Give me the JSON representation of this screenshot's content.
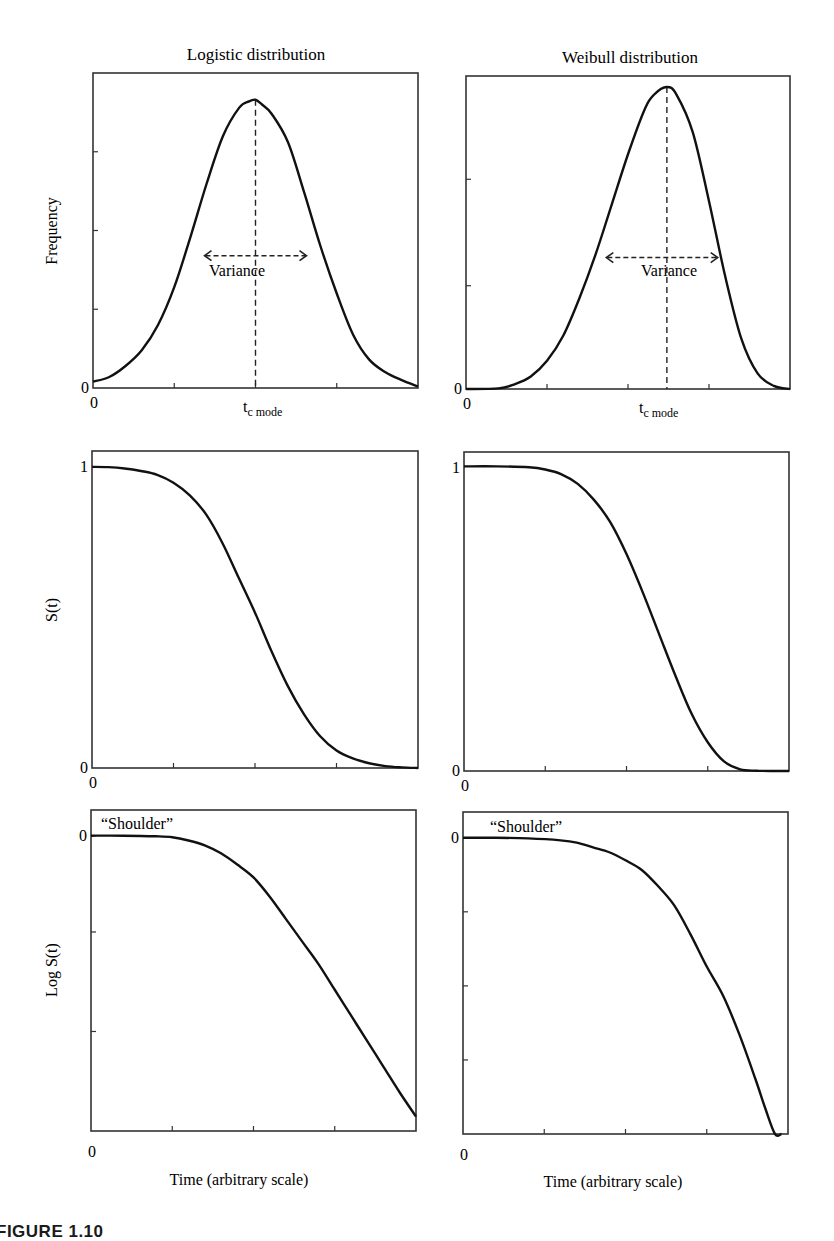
{
  "figure": {
    "caption": "FIGURE 1.10"
  },
  "columns": [
    {
      "title": "Logistic distribution"
    },
    {
      "title": "Weibull distribution"
    }
  ],
  "ylabels": [
    "Frequency",
    "S(t)",
    "Log S(t)"
  ],
  "xlabel": "Time (arbitrary scale)",
  "annotations": {
    "variance": "Variance",
    "mode": "t",
    "mode_sub": "c mode",
    "shoulder_left": "“Shoulder”",
    "shoulder_right": "“Shoulder”"
  },
  "chart_data": [
    {
      "type": "line",
      "title": "Logistic distribution",
      "ylabel": "Frequency",
      "xlabel": "",
      "panel": {
        "x": 93,
        "y": 73,
        "w": 325,
        "h": 315
      },
      "ytick_labels": {
        "0": "0"
      },
      "xtick_labels": {
        "0": "0",
        "0.5": "t_c mode"
      },
      "xticks": [
        0.25,
        0.5,
        0.75
      ],
      "yticks": [
        0.25,
        0.5,
        0.75
      ],
      "mode_x": 0.5,
      "variance": {
        "y": 0.42,
        "x1": 0.34,
        "x2": 0.66
      },
      "x": [
        0,
        0.05,
        0.1,
        0.15,
        0.2,
        0.25,
        0.3,
        0.35,
        0.4,
        0.45,
        0.48,
        0.5,
        0.52,
        0.55,
        0.6,
        0.65,
        0.7,
        0.75,
        0.8,
        0.85,
        0.9,
        0.95,
        1
      ],
      "y": [
        0.02,
        0.035,
        0.07,
        0.12,
        0.2,
        0.32,
        0.48,
        0.65,
        0.8,
        0.89,
        0.91,
        0.915,
        0.9,
        0.87,
        0.78,
        0.62,
        0.45,
        0.3,
        0.17,
        0.09,
        0.05,
        0.025,
        0.005
      ]
    },
    {
      "type": "line",
      "title": "Weibull distribution",
      "ylabel": "",
      "xlabel": "",
      "panel": {
        "x": 466,
        "y": 76,
        "w": 324,
        "h": 313
      },
      "ytick_labels": {
        "0": "0"
      },
      "xtick_labels": {
        "0": "0",
        "0.62": "t_c mode"
      },
      "xticks": [
        0.25,
        0.5,
        0.75
      ],
      "yticks": [
        0.33,
        0.67
      ],
      "mode_x": 0.62,
      "variance": {
        "y": 0.42,
        "x1": 0.43,
        "x2": 0.78
      },
      "x": [
        0,
        0.1,
        0.15,
        0.2,
        0.25,
        0.3,
        0.35,
        0.4,
        0.45,
        0.5,
        0.55,
        0.58,
        0.62,
        0.65,
        0.7,
        0.75,
        0.8,
        0.85,
        0.9,
        0.95,
        1
      ],
      "y": [
        0,
        0.002,
        0.015,
        0.04,
        0.09,
        0.17,
        0.29,
        0.43,
        0.59,
        0.75,
        0.89,
        0.94,
        0.965,
        0.94,
        0.82,
        0.6,
        0.36,
        0.16,
        0.05,
        0.01,
        0
      ]
    },
    {
      "type": "line",
      "title": "",
      "ylabel": "S(t)",
      "xlabel": "",
      "panel": {
        "x": 92,
        "y": 451,
        "w": 326,
        "h": 317
      },
      "ytick_labels": {
        "0": "0",
        "0.95": "1"
      },
      "xtick_labels": {
        "0": "0"
      },
      "xticks": [
        0.25,
        0.5,
        0.75
      ],
      "yticks": [],
      "x": [
        0,
        0.05,
        0.1,
        0.15,
        0.2,
        0.25,
        0.3,
        0.35,
        0.4,
        0.45,
        0.5,
        0.55,
        0.6,
        0.65,
        0.7,
        0.75,
        0.8,
        0.85,
        0.9,
        0.95,
        1
      ],
      "y": [
        0.95,
        0.949,
        0.945,
        0.937,
        0.925,
        0.9,
        0.86,
        0.8,
        0.71,
        0.6,
        0.49,
        0.37,
        0.26,
        0.17,
        0.1,
        0.055,
        0.03,
        0.015,
        0.006,
        0.002,
        0
      ]
    },
    {
      "type": "line",
      "title": "",
      "ylabel": "",
      "xlabel": "",
      "panel": {
        "x": 464,
        "y": 452,
        "w": 325,
        "h": 319
      },
      "ytick_labels": {
        "0": "0",
        "0.95": "1"
      },
      "xtick_labels": {
        "0": "0"
      },
      "xticks": [
        0.25,
        0.5,
        0.75
      ],
      "yticks": [],
      "x": [
        0,
        0.1,
        0.2,
        0.25,
        0.3,
        0.35,
        0.4,
        0.45,
        0.5,
        0.55,
        0.6,
        0.65,
        0.7,
        0.75,
        0.8,
        0.85,
        0.9,
        0.95,
        1
      ],
      "y": [
        0.955,
        0.955,
        0.952,
        0.945,
        0.93,
        0.9,
        0.85,
        0.78,
        0.68,
        0.56,
        0.43,
        0.3,
        0.18,
        0.09,
        0.03,
        0.005,
        0.001,
        0,
        0
      ]
    },
    {
      "type": "line",
      "title": "",
      "ylabel": "Log S(t)",
      "xlabel": "Time (arbitrary scale)",
      "panel": {
        "x": 91,
        "y": 810,
        "w": 325,
        "h": 321
      },
      "ytick_labels": {
        "0.92": "0"
      },
      "xtick_labels": {
        "-0.06": "0"
      },
      "xticks": [
        0.25,
        0.5,
        0.75
      ],
      "yticks": [
        0.31,
        0.62
      ],
      "x": [
        0,
        0.1,
        0.2,
        0.25,
        0.3,
        0.35,
        0.4,
        0.45,
        0.5,
        0.55,
        0.6,
        0.65,
        0.7,
        0.75,
        0.8,
        0.85,
        0.9,
        0.95,
        1
      ],
      "y": [
        0.92,
        0.92,
        0.918,
        0.915,
        0.905,
        0.89,
        0.865,
        0.83,
        0.79,
        0.73,
        0.66,
        0.59,
        0.52,
        0.44,
        0.36,
        0.28,
        0.2,
        0.12,
        0.045
      ]
    },
    {
      "type": "line",
      "title": "",
      "ylabel": "",
      "xlabel": "Time (arbitrary scale)",
      "panel": {
        "x": 463,
        "y": 812,
        "w": 325,
        "h": 322
      },
      "ytick_labels": {
        "0.92": "0"
      },
      "xtick_labels": {
        "-0.06": "0"
      },
      "xticks": [
        0.25,
        0.5,
        0.75
      ],
      "yticks": [
        0.23,
        0.46,
        0.69
      ],
      "x": [
        0,
        0.1,
        0.2,
        0.3,
        0.35,
        0.4,
        0.45,
        0.5,
        0.55,
        0.6,
        0.65,
        0.7,
        0.75,
        0.8,
        0.85,
        0.9,
        0.93,
        0.96,
        0.98
      ],
      "y": [
        0.92,
        0.92,
        0.918,
        0.912,
        0.905,
        0.89,
        0.875,
        0.85,
        0.82,
        0.77,
        0.71,
        0.62,
        0.52,
        0.43,
        0.31,
        0.17,
        0.08,
        0.0,
        0.0
      ]
    }
  ]
}
